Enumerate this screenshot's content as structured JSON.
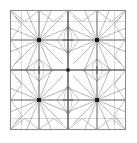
{
  "figure": {
    "background_color": "#ffffff",
    "line_color": "#808080",
    "accent_line_color": "#4a4a4a",
    "hub_color": "#1a1a1a",
    "frame": {
      "x": 10.5,
      "y": 10.5,
      "width": 115,
      "height": 119,
      "stroke_width": 1.1,
      "stroke_color": "#8c8c8c"
    },
    "center_cross": {
      "cx": 68,
      "cy": 70,
      "stroke_width": 1.2,
      "stroke_color": "#5a5a5a"
    },
    "hubs": [
      {
        "name": "hub-top-left",
        "cx": 39,
        "cy": 40,
        "r": 2.0
      },
      {
        "name": "hub-top-right",
        "cx": 97,
        "cy": 40,
        "r": 2.0
      },
      {
        "name": "hub-bottom-left",
        "cx": 39,
        "cy": 100,
        "r": 2.0
      },
      {
        "name": "hub-bottom-right",
        "cx": 97,
        "cy": 100,
        "r": 2.0
      }
    ],
    "hub_spokes": {
      "count": 16,
      "start_angle_deg": 0,
      "length": 34,
      "stroke_width": 0.7
    },
    "quadrant_cells": [
      {
        "name": "cell-top-left",
        "x": 10.5,
        "y": 10.5,
        "w": 57.5,
        "h": 59.5
      },
      {
        "name": "cell-top-right",
        "x": 68,
        "y": 10.5,
        "w": 57.5,
        "h": 59.5
      },
      {
        "name": "cell-bottom-left",
        "x": 10.5,
        "y": 70,
        "w": 57.5,
        "h": 59.5
      },
      {
        "name": "cell-bottom-right",
        "x": 68,
        "y": 70,
        "w": 57.5,
        "h": 59.5
      }
    ],
    "midpoints": [
      {
        "name": "mid-top",
        "x": 68,
        "y": 10.5
      },
      {
        "name": "mid-bottom",
        "x": 68,
        "y": 129.5
      },
      {
        "name": "mid-left",
        "x": 10.5,
        "y": 70
      },
      {
        "name": "mid-right",
        "x": 125,
        "y": 70
      }
    ],
    "lens_motifs": [
      {
        "name": "lens-top",
        "cx": 68,
        "cy": 40,
        "rx": 11,
        "ry": 14
      },
      {
        "name": "lens-bottom",
        "cx": 68,
        "cy": 100,
        "rx": 11,
        "ry": 14
      },
      {
        "name": "lens-left",
        "cx": 39,
        "cy": 70,
        "rx": 14,
        "ry": 11
      },
      {
        "name": "lens-right",
        "cx": 97,
        "cy": 70,
        "rx": 14,
        "ry": 11
      }
    ],
    "edge_zigzag": {
      "name": "edge-zigzag-band",
      "inset": 11,
      "segments_per_side": 4,
      "stroke_width": 0.65
    },
    "labels": {
      "caption": ""
    }
  }
}
